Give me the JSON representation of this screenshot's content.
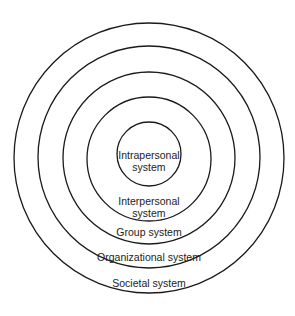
{
  "diagram": {
    "type": "concentric-circles",
    "stroke_color": "#1a1a1a",
    "background": "#ffffff",
    "circles": [
      {
        "name": "intrapersonal",
        "label_lines": [
          "Intrapersonal",
          "system"
        ],
        "cx": 149,
        "cy": 154,
        "r": 32
      },
      {
        "name": "interpersonal",
        "label_lines": [
          "Interpersonal",
          "system"
        ],
        "cx": 149,
        "cy": 159,
        "r": 62
      },
      {
        "name": "group",
        "label_lines": [
          "Group system"
        ],
        "cx": 149,
        "cy": 158,
        "r": 86
      },
      {
        "name": "organizational",
        "label_lines": [
          "Organizational system"
        ],
        "cx": 149,
        "cy": 157,
        "r": 111
      },
      {
        "name": "societal",
        "label_lines": [
          "Societal system"
        ],
        "cx": 149,
        "cy": 158,
        "r": 135
      }
    ]
  }
}
